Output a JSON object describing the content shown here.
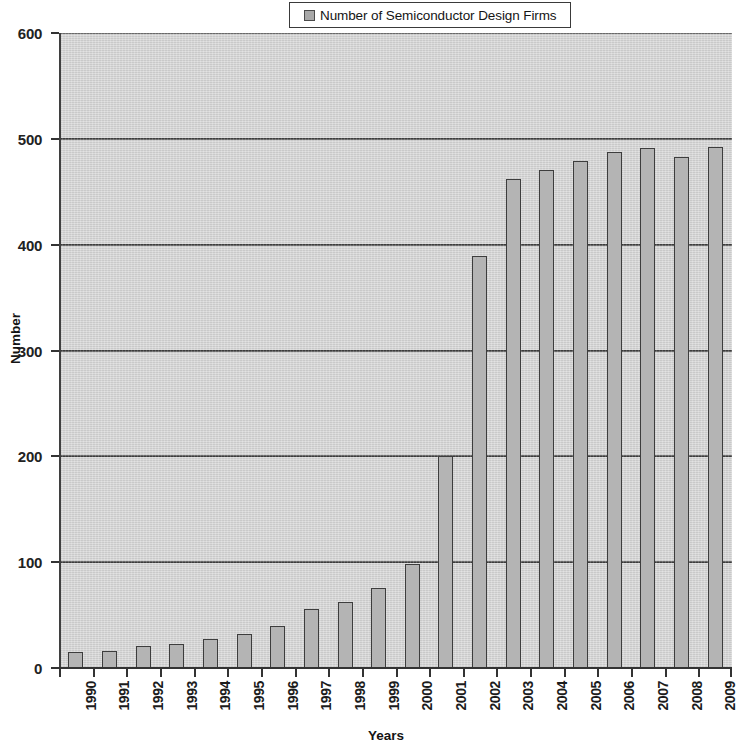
{
  "chart_data": {
    "type": "bar",
    "title": "",
    "xlabel": "Years",
    "ylabel": "Number",
    "legend": [
      "Number of Semiconductor Design Firms"
    ],
    "legend_position": "top-center",
    "grid": true,
    "ylim": [
      0,
      600
    ],
    "yticks": [
      0,
      100,
      200,
      300,
      400,
      500,
      600
    ],
    "categories": [
      "1990",
      "1991",
      "1992",
      "1993",
      "1994",
      "1995",
      "1996",
      "1997",
      "1998",
      "1999",
      "2000",
      "2001",
      "2002",
      "2003",
      "2004",
      "2005",
      "2006",
      "2007",
      "2008",
      "2009"
    ],
    "series": [
      {
        "name": "Number of Semiconductor Design Firms",
        "values": [
          15,
          16,
          21,
          23,
          27,
          32,
          40,
          56,
          62,
          76,
          98,
          200,
          389,
          462,
          471,
          479,
          488,
          491,
          483,
          492
        ]
      }
    ]
  },
  "legend": {
    "label": "Number of Semiconductor Design Firms",
    "swatch_color": "#a8a8a8"
  },
  "axes": {
    "y_title": "Number",
    "x_title": "Years",
    "y_tick_labels": [
      "600",
      "500",
      "400",
      "300",
      "200",
      "100",
      "0"
    ],
    "x_tick_labels": [
      "1990",
      "1991",
      "1992",
      "1993",
      "1994",
      "1995",
      "1996",
      "1997",
      "1998",
      "1999",
      "2000",
      "2001",
      "2002",
      "2003",
      "2004",
      "2005",
      "2006",
      "2007",
      "2008",
      "2009"
    ]
  },
  "style": {
    "plot_background": "#d4d4d4",
    "bar_fill": "#b4b4b4",
    "bar_border": "#3d3d3d",
    "gridline_color": "#3f3f3f",
    "axis_color": "#333333"
  }
}
